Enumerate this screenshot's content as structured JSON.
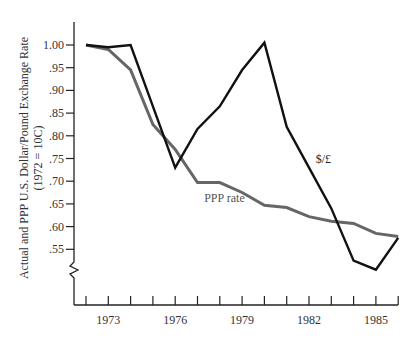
{
  "chart_data": {
    "type": "line",
    "title": "",
    "xlabel": "",
    "ylabel": "Actual and PPP U.S. Dollar/Pound Exchange Rate",
    "ylabel_sub": "(1972 = 10C)",
    "x": [
      1972,
      1973,
      1974,
      1975,
      1976,
      1977,
      1978,
      1979,
      1980,
      1981,
      1982,
      1983,
      1984,
      1985,
      1986
    ],
    "x_tick_labels": [
      "1973",
      "1976",
      "1979",
      "1982",
      "1985"
    ],
    "x_tick_label_years": [
      1973,
      1976,
      1979,
      1982,
      1985
    ],
    "y_ticks": [
      1.0,
      0.95,
      0.9,
      0.85,
      0.8,
      0.75,
      0.7,
      0.65,
      0.6,
      0.55
    ],
    "y_tick_labels": [
      "1.00",
      ".95",
      ".90",
      ".85",
      ".80",
      ".75",
      ".70",
      ".65",
      ".60",
      ".55"
    ],
    "ylim": [
      0.55,
      1.0
    ],
    "y_axis_break": true,
    "grid": false,
    "legend": "inline labels",
    "series": [
      {
        "name": "$/£",
        "color": "#111111",
        "label_pos": [
          1982.3,
          0.74
        ],
        "values": [
          1.0,
          0.995,
          1.0,
          0.865,
          0.73,
          0.815,
          0.865,
          0.945,
          1.005,
          0.82,
          0.73,
          0.64,
          0.525,
          0.505,
          0.575
        ]
      },
      {
        "name": "PPP rate",
        "color": "#666666",
        "label_pos": [
          1977.3,
          0.655
        ],
        "values": [
          1.0,
          0.99,
          0.945,
          0.825,
          0.77,
          0.697,
          0.697,
          0.675,
          0.647,
          0.642,
          0.622,
          0.612,
          0.607,
          0.585,
          0.578
        ]
      }
    ]
  }
}
